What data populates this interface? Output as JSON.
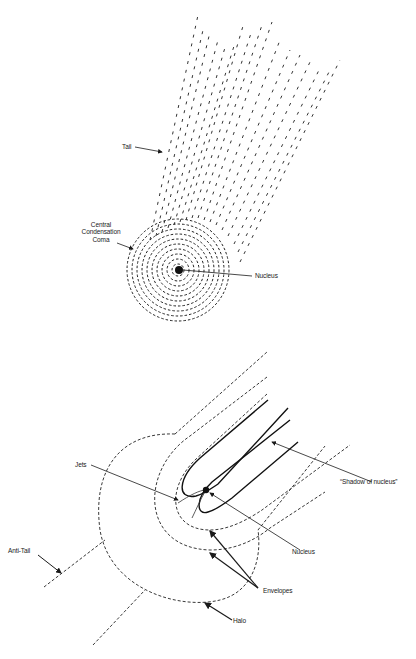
{
  "figure": {
    "top_panel": {
      "title": "Comet structure (visible)",
      "labels": {
        "tail": "Tail",
        "coma_line1": "Central",
        "coma_line2": "Condensation",
        "coma_line3": "Coma",
        "nucleus": "Nucleus"
      }
    },
    "bottom_panel": {
      "title": "Comet structure (detailed)",
      "labels": {
        "jets": "Jets",
        "shadow": "“Shadow of nucleus”",
        "nucleus": "Nucleus",
        "envelopes": "Envelopes",
        "halo": "Halo",
        "anti_tail": "Anti-Tail"
      }
    },
    "colors": {
      "ink": "#1a1a1a",
      "background": "#ffffff"
    }
  }
}
